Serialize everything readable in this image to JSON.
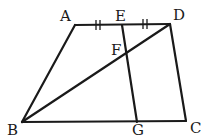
{
  "figure": {
    "type": "trapezoid geometry diagram",
    "points": [
      {
        "name": "A",
        "label": "A"
      },
      {
        "name": "E",
        "label": "E"
      },
      {
        "name": "D",
        "label": "D"
      },
      {
        "name": "F",
        "label": "F"
      },
      {
        "name": "B",
        "label": "B"
      },
      {
        "name": "G",
        "label": "G"
      },
      {
        "name": "C",
        "label": "C"
      }
    ],
    "segments": [
      "AD",
      "AB",
      "BC",
      "CD",
      "BD",
      "EG"
    ],
    "equal_marks": {
      "segments": [
        "AE",
        "ED"
      ],
      "mark": "double tick"
    },
    "intersection": {
      "point": "F",
      "of": [
        "BD",
        "EG"
      ]
    }
  }
}
